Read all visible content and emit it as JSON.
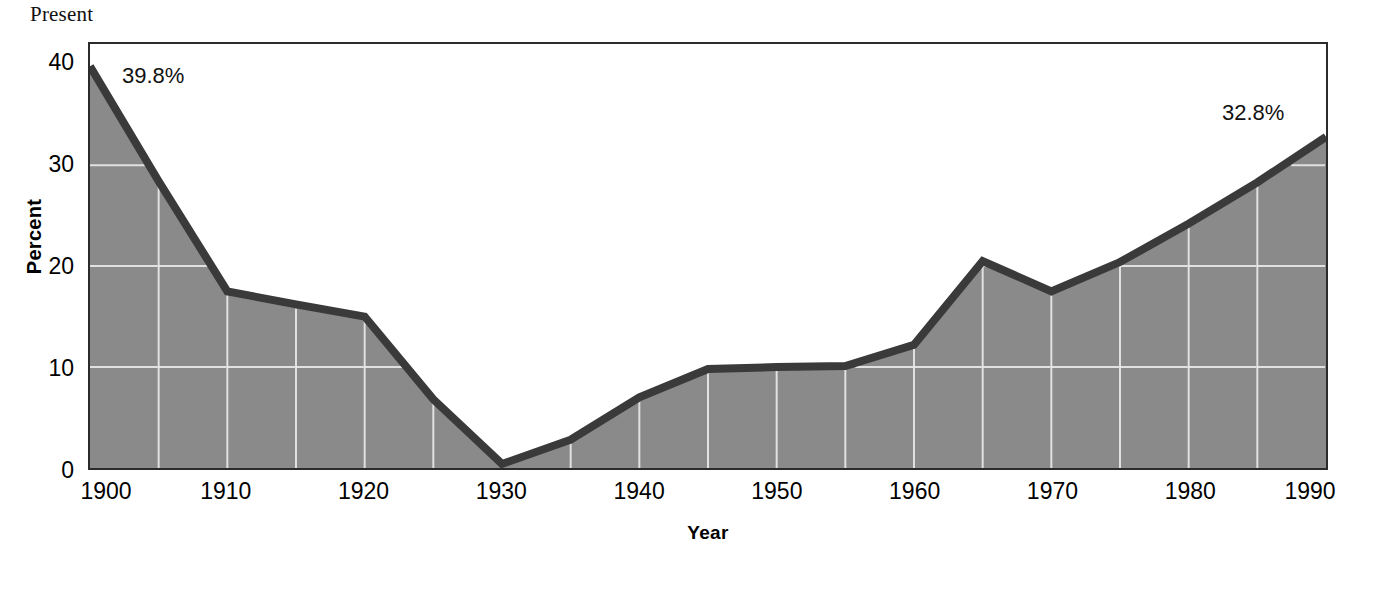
{
  "chart_title": "Present",
  "annotations": {
    "start": "39.8%",
    "end": "32.8%"
  },
  "axis": {
    "y_title": "Percent",
    "x_title": "Year",
    "y_ticks": [
      "0",
      "10",
      "20",
      "30",
      "40"
    ],
    "x_ticks": [
      "1900",
      "1910",
      "1920",
      "1930",
      "1940",
      "1950",
      "1960",
      "1970",
      "1980",
      "1990"
    ]
  },
  "colors": {
    "area_fill": "#8a8a8a",
    "line": "#3a3a3a",
    "gridline": "#f0f0f0",
    "frame": "#2b2b2b",
    "background": "#ffffff"
  },
  "chart_data": {
    "type": "area",
    "title": "Present",
    "xlabel": "Year",
    "ylabel": "Percent",
    "xlim": [
      1900,
      1990
    ],
    "ylim": [
      0,
      42
    ],
    "grid": true,
    "legend": "none",
    "x": [
      1900,
      1905,
      1910,
      1915,
      1920,
      1925,
      1930,
      1935,
      1940,
      1945,
      1950,
      1955,
      1960,
      1965,
      1970,
      1975,
      1980,
      1985,
      1990
    ],
    "values": [
      39.8,
      28.4,
      17.5,
      16.2,
      15.0,
      6.8,
      0.4,
      2.8,
      7.0,
      9.8,
      10.0,
      10.1,
      12.2,
      20.5,
      17.5,
      20.4,
      24.2,
      28.3,
      32.8
    ],
    "series": [
      {
        "name": "Percent",
        "values": [
          39.8,
          28.4,
          17.5,
          16.2,
          15.0,
          6.8,
          0.4,
          2.8,
          7.0,
          9.8,
          10.0,
          10.1,
          12.2,
          20.5,
          17.5,
          20.4,
          24.2,
          28.3,
          32.8
        ]
      }
    ],
    "data_labels": [
      {
        "x": 1900,
        "y": 39.8,
        "text": "39.8%"
      },
      {
        "x": 1990,
        "y": 32.8,
        "text": "32.8%"
      }
    ],
    "y_tick_values": [
      0,
      10,
      20,
      30,
      40
    ],
    "x_tick_values": [
      1900,
      1910,
      1920,
      1930,
      1940,
      1950,
      1960,
      1970,
      1980,
      1990
    ],
    "x_gridline_values": [
      1905,
      1910,
      1915,
      1920,
      1925,
      1930,
      1935,
      1940,
      1945,
      1950,
      1955,
      1960,
      1965,
      1970,
      1975,
      1980,
      1985
    ],
    "y_gridline_values": [
      10,
      20,
      30
    ]
  }
}
